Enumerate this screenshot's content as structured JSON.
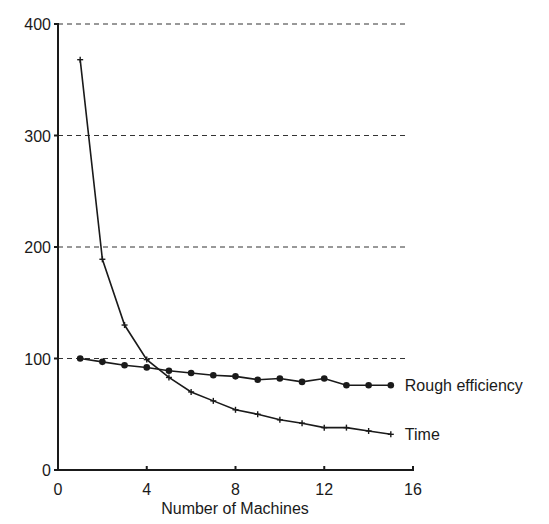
{
  "chart_data": {
    "type": "line",
    "title": "",
    "xlabel": "Number of Machines",
    "ylabel": "",
    "xlim": [
      0,
      16
    ],
    "ylim": [
      0,
      400
    ],
    "xticks": [
      0,
      4,
      8,
      12,
      16
    ],
    "yticks": [
      0,
      100,
      200,
      300,
      400
    ],
    "grid": "horizontal dashed",
    "legend_placement": "inline-right",
    "x": [
      1,
      2,
      3,
      4,
      5,
      6,
      7,
      8,
      9,
      10,
      11,
      12,
      13,
      14,
      15
    ],
    "series": [
      {
        "name": "Rough efficiency",
        "marker": "circle",
        "values": [
          100,
          97,
          94,
          92,
          89,
          87,
          85,
          84,
          81,
          82,
          79,
          82,
          76,
          76,
          76
        ]
      },
      {
        "name": "Time",
        "marker": "plus",
        "values": [
          368,
          189,
          130,
          99,
          83,
          70,
          62,
          54,
          50,
          45,
          42,
          38,
          38,
          35,
          32
        ]
      }
    ],
    "colors": {
      "line": "#1a1a1a",
      "grid": "#333333",
      "background": "#ffffff"
    }
  }
}
